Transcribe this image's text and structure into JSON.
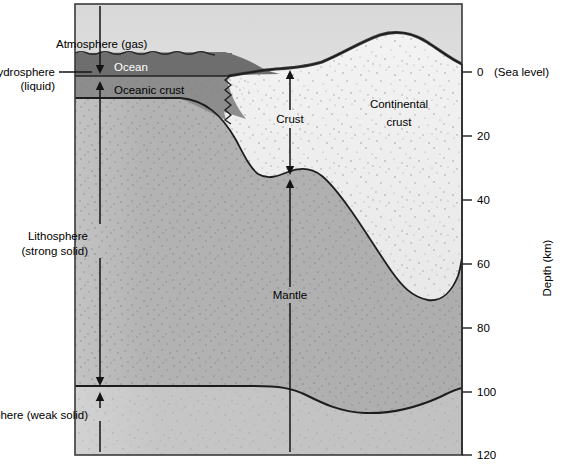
{
  "figure": {
    "type": "geological-cross-section",
    "title_visible": false,
    "labels": {
      "atmosphere": "Atmosphere (gas)",
      "hydrosphere_line1": "Hydrosphere",
      "hydrosphere_line2": "(liquid)",
      "ocean": "Ocean",
      "oceanic_crust": "Oceanic crust",
      "crust": "Crust",
      "continental_crust_line1": "Continental",
      "continental_crust_line2": "crust",
      "mantle": "Mantle",
      "lithosphere_line1": "Lithosphere",
      "lithosphere_line2": "(strong solid)",
      "asthenosphere": "Asthenosphere (weak solid)"
    },
    "axis": {
      "title": "Depth (km)",
      "ticks": [
        {
          "value": "0",
          "suffix": "(Sea level)",
          "depth_km": 0
        },
        {
          "value": "20",
          "suffix": "",
          "depth_km": 20
        },
        {
          "value": "40",
          "suffix": "",
          "depth_km": 40
        },
        {
          "value": "60",
          "suffix": "",
          "depth_km": 60
        },
        {
          "value": "80",
          "suffix": "",
          "depth_km": 80
        },
        {
          "value": "100",
          "suffix": "",
          "depth_km": 100
        },
        {
          "value": "120",
          "suffix": "",
          "depth_km": 120
        }
      ],
      "range_km": [
        0,
        120
      ]
    },
    "colors": {
      "ocean": "#6f6f6f",
      "oceanic_crust": "#8e8e8e",
      "continental_crust": "#eeeeee",
      "mantle_lithosphere": "#b5b5b5",
      "asthenosphere": "#c9c9c9",
      "atmosphere": "#f2f2f2",
      "outline": "#1a1a1a",
      "background": "#ffffff"
    }
  }
}
